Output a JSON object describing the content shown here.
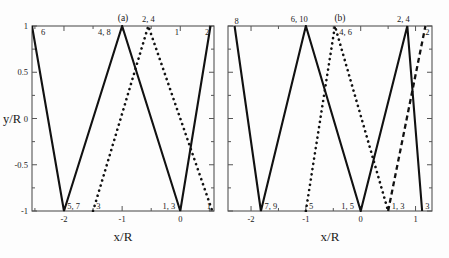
{
  "figure": {
    "panels": [
      {
        "tag": "(a)",
        "axes": {
          "xlabel": "x/R",
          "ylabel": "y/R",
          "xticks": [
            {
              "value": -2,
              "label": "-2"
            },
            {
              "value": -1,
              "label": "-1"
            },
            {
              "value": 0,
              "label": "0"
            }
          ],
          "xminor": [
            -2.5,
            -1.5,
            -0.5,
            0.5
          ],
          "yticks": [
            {
              "value": 1,
              "label": "1"
            },
            {
              "value": 0.5,
              "label": "0.5"
            },
            {
              "value": 0,
              "label": "0"
            },
            {
              "value": -0.5,
              "label": "-0.5"
            },
            {
              "value": -1,
              "label": "-1"
            }
          ],
          "yminor": [
            0.75,
            0.25,
            -0.25,
            -0.75
          ],
          "xlim": [
            -2.55,
            0.58
          ],
          "ylim": [
            -1,
            1
          ]
        },
        "curves": [
          {
            "name": "solid-trajectory",
            "style": "solid",
            "points": [
              [
                -2.55,
                1
              ],
              [
                -2.0,
                -1
              ],
              [
                -1.0,
                1
              ],
              [
                0.0,
                -1
              ],
              [
                0.52,
                1
              ]
            ]
          },
          {
            "name": "dotted-trajectory",
            "style": "dotted",
            "points": [
              [
                -1.5,
                -1
              ],
              [
                -0.55,
                1
              ],
              [
                0.55,
                -1
              ]
            ]
          }
        ],
        "annotations": [
          {
            "text": "6",
            "x": -2.42,
            "y": 1,
            "place": "below-right"
          },
          {
            "text": "4, 8",
            "x": -1.18,
            "y": 1,
            "place": "below-left"
          },
          {
            "text": "2, 4",
            "x": -0.55,
            "y": 1,
            "place": "above"
          },
          {
            "text": "1",
            "x": -0.12,
            "y": 1,
            "place": "below-right"
          },
          {
            "text": "2",
            "x": 0.4,
            "y": 1,
            "place": "below-right"
          },
          {
            "text": "5, 7",
            "x": -1.97,
            "y": -1,
            "place": "above-right"
          },
          {
            "text": "3",
            "x": -1.47,
            "y": -1,
            "place": "above-right"
          },
          {
            "text": "1, 3",
            "x": -0.33,
            "y": -1,
            "place": "above-right"
          },
          {
            "text": "1",
            "x": 0.43,
            "y": -1,
            "place": "above-right"
          }
        ]
      },
      {
        "tag": "(b)",
        "axes": {
          "xlabel": "x/R",
          "ylabel": "",
          "xticks": [
            {
              "value": -2,
              "label": "-2"
            },
            {
              "value": -1,
              "label": "-1"
            },
            {
              "value": 0,
              "label": "0"
            },
            {
              "value": 1,
              "label": "1"
            }
          ],
          "xminor": [
            -2.5,
            -1.5,
            -0.5,
            0.5
          ],
          "yticks": [
            {
              "value": 1,
              "label": ""
            },
            {
              "value": 0.5,
              "label": ""
            },
            {
              "value": 0,
              "label": ""
            },
            {
              "value": -0.5,
              "label": ""
            },
            {
              "value": -1,
              "label": ""
            }
          ],
          "yminor": [
            0.75,
            0.25,
            -0.25,
            -0.75
          ],
          "xlim": [
            -2.42,
            1.3
          ],
          "ylim": [
            -1,
            1
          ]
        },
        "curves": [
          {
            "name": "solid-trajectory",
            "style": "solid",
            "points": [
              [
                -2.3,
                1
              ],
              [
                -1.82,
                -1
              ],
              [
                -1.0,
                1
              ],
              [
                0.0,
                -1
              ],
              [
                0.85,
                1
              ],
              [
                1.12,
                -1
              ]
            ]
          },
          {
            "name": "dotted-trajectory",
            "style": "dotted",
            "points": [
              [
                -1.0,
                -1
              ],
              [
                -0.47,
                1
              ],
              [
                0.5,
                -1
              ]
            ]
          },
          {
            "name": "dashed-trajectory",
            "style": "dashed",
            "points": [
              [
                0.5,
                -1
              ],
              [
                1.18,
                1
              ]
            ]
          }
        ],
        "annotations": [
          {
            "text": "8",
            "x": -2.33,
            "y": 1,
            "place": "above-right"
          },
          {
            "text": "6, 10",
            "x": -1.12,
            "y": 1,
            "place": "above"
          },
          {
            "text": "4, 6",
            "x": -0.42,
            "y": 1,
            "place": "below-right"
          },
          {
            "text": "2, 4",
            "x": 0.78,
            "y": 1,
            "place": "above"
          },
          {
            "text": "2",
            "x": 1.15,
            "y": 1,
            "place": "below-right"
          },
          {
            "text": "7, 9",
            "x": -1.78,
            "y": -1,
            "place": "above-right"
          },
          {
            "text": "5",
            "x": -0.97,
            "y": -1,
            "place": "above-right"
          },
          {
            "text": "1, 5",
            "x": -0.38,
            "y": -1,
            "place": "above-right"
          },
          {
            "text": "1, 3",
            "x": 0.54,
            "y": -1,
            "place": "above-right"
          },
          {
            "text": "3",
            "x": 1.15,
            "y": -1,
            "place": "above-right"
          }
        ]
      }
    ]
  },
  "chart_data": {
    "type": "line",
    "title": "",
    "panels": [
      {
        "tag": "(a)",
        "xlabel": "x/R",
        "ylabel": "y/R",
        "xlim": [
          -2.55,
          0.58
        ],
        "ylim": [
          -1,
          1
        ],
        "xticks": [
          -2,
          -1,
          0
        ],
        "yticks": [
          1,
          0.5,
          0,
          -0.5,
          -1
        ],
        "grid": false,
        "legend": "none",
        "series": [
          {
            "name": "solid-trajectory",
            "style": "solid",
            "x": [
              -2.55,
              -2.0,
              -1.0,
              0.0,
              0.52
            ],
            "y": [
              1,
              -1,
              1,
              -1,
              1
            ],
            "bounce_labels": [
              "6",
              "5, 7",
              "4, 8",
              "1, 3",
              "2"
            ]
          },
          {
            "name": "dotted-trajectory",
            "style": "dotted",
            "x": [
              -1.5,
              -0.55,
              0.55
            ],
            "y": [
              -1,
              1,
              -1
            ],
            "bounce_labels": [
              "3",
              "2, 4",
              "1"
            ]
          }
        ]
      },
      {
        "tag": "(b)",
        "xlabel": "x/R",
        "ylabel": "",
        "xlim": [
          -2.42,
          1.3
        ],
        "ylim": [
          -1,
          1
        ],
        "xticks": [
          -2,
          -1,
          0,
          1
        ],
        "yticks": [
          1,
          0.5,
          0,
          -0.5,
          -1
        ],
        "grid": false,
        "legend": "none",
        "series": [
          {
            "name": "solid-trajectory",
            "style": "solid",
            "x": [
              -2.3,
              -1.82,
              -1.0,
              0.0,
              0.85,
              1.12
            ],
            "y": [
              1,
              -1,
              1,
              -1,
              1,
              -1
            ],
            "bounce_labels": [
              "8",
              "7, 9",
              "6, 10",
              "1, 5",
              "2, 4",
              "3"
            ]
          },
          {
            "name": "dotted-trajectory",
            "style": "dotted",
            "x": [
              -1.0,
              -0.47,
              0.5
            ],
            "y": [
              -1,
              1,
              -1
            ],
            "bounce_labels": [
              "5",
              "4, 6",
              "1, 3"
            ]
          },
          {
            "name": "dashed-trajectory",
            "style": "dashed",
            "x": [
              0.5,
              1.18
            ],
            "y": [
              -1,
              1
            ],
            "bounce_labels": [
              "1, 3",
              "2"
            ]
          }
        ]
      }
    ]
  }
}
